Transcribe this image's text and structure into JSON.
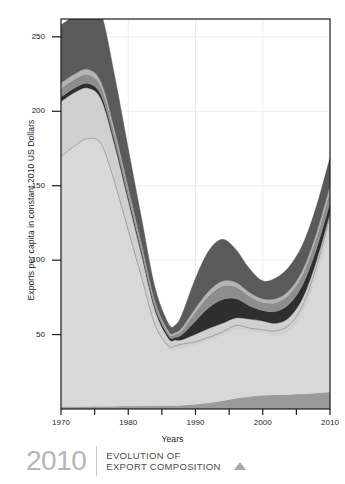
{
  "chart_data": {
    "type": "area",
    "stacked": true,
    "title": "",
    "xlabel": "Years",
    "ylabel": "Exports per capita in constant 2010 US Dollars",
    "xlim": [
      1970,
      2010
    ],
    "ylim": [
      0,
      262
    ],
    "yticks": [
      50,
      100,
      150,
      200,
      250
    ],
    "ytick_labels": [
      "50",
      "100",
      "150",
      "200",
      "250"
    ],
    "xticks": [
      1970,
      1980,
      1990,
      2000,
      2010
    ],
    "xtick_labels": [
      "1970",
      "1980",
      "1990",
      "2000",
      "2010"
    ],
    "xminor_ticks": [
      1975,
      1985,
      1995,
      2005
    ],
    "grid": true,
    "legend": "none",
    "x": [
      1970,
      1972,
      1974,
      1976,
      1978,
      1980,
      1982,
      1984,
      1986,
      1987,
      1988,
      1990,
      1992,
      1994,
      1996,
      1998,
      2000,
      2002,
      2004,
      2006,
      2008,
      2010
    ],
    "series": [
      {
        "name": "series-1-bottom",
        "color": "#9a9a9a",
        "values": [
          1.5,
          1.6,
          1.7,
          1.8,
          1.9,
          2.0,
          2.1,
          2.2,
          2.3,
          2.4,
          2.6,
          3.2,
          4.2,
          5.6,
          7.2,
          8.4,
          9.2,
          9.6,
          9.8,
          10.2,
          10.8,
          11.5
        ]
      },
      {
        "name": "series-2",
        "color": "#d8d8d8",
        "values": [
          168,
          175,
          180,
          176,
          150,
          118,
          86,
          54,
          38,
          38,
          38,
          40,
          42,
          44,
          46,
          44,
          42,
          40,
          43,
          55,
          78,
          108
        ]
      },
      {
        "name": "series-3",
        "color": "#d0d0d0",
        "values": [
          37,
          36,
          34,
          30,
          25,
          20,
          15,
          10,
          7,
          6,
          6,
          7,
          8,
          8,
          8,
          8,
          8,
          8,
          9,
          10,
          11,
          12
        ]
      },
      {
        "name": "series-4-dark",
        "color": "#2e2e2e",
        "values": [
          3.0,
          3.0,
          3.0,
          2.8,
          2.6,
          2.4,
          2.2,
          2.0,
          1.8,
          1.8,
          3.5,
          9.0,
          14.0,
          16.0,
          13.0,
          9.0,
          7.0,
          8.0,
          9.0,
          9.0,
          8.0,
          7.0
        ]
      },
      {
        "name": "series-5",
        "color": "#8d8d8d",
        "values": [
          6.0,
          6.0,
          6.0,
          5.6,
          5.0,
          4.2,
          3.4,
          2.6,
          2.0,
          2.0,
          3.0,
          6.0,
          8.0,
          9.0,
          8.0,
          6.5,
          5.5,
          6.0,
          6.5,
          7.0,
          7.5,
          8.0
        ]
      },
      {
        "name": "series-6",
        "color": "#b4b4b4",
        "values": [
          3.5,
          3.5,
          3.5,
          3.2,
          2.8,
          2.4,
          2.0,
          1.5,
          1.2,
          1.2,
          1.6,
          2.6,
          3.2,
          3.4,
          3.0,
          2.6,
          2.4,
          2.6,
          2.8,
          3.0,
          3.2,
          3.4
        ]
      },
      {
        "name": "series-7-top",
        "color": "#5a5a5a",
        "values": [
          39,
          40,
          48,
          46,
          36,
          26,
          17,
          9,
          5,
          5,
          9,
          20,
          27,
          28,
          22,
          16,
          12,
          14,
          16,
          17,
          18,
          19
        ]
      }
    ],
    "overlay_line": {
      "name": "reference-line",
      "color": "#8b8b8b",
      "values": [
        168,
        175,
        180,
        176,
        150,
        118,
        86,
        54,
        40,
        40,
        41,
        42,
        44,
        46,
        49,
        46,
        44,
        43,
        47,
        60,
        85,
        118
      ]
    }
  },
  "footer": {
    "year": "2010",
    "title_line1": "EVOLUTION OF",
    "title_line2": "EXPORT COMPOSITION",
    "caret_icon": "triangle-up-icon"
  }
}
